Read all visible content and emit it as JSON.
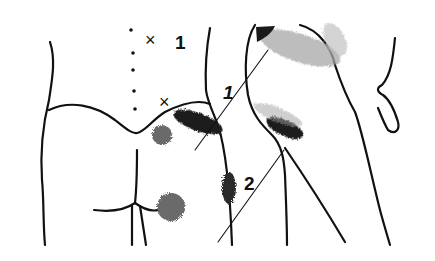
{
  "diagram": {
    "type": "anatomical trigger point / pain referral diagram",
    "view": "posterior lower back, buttocks and lateral hip/thigh",
    "markers": [
      {
        "id": "x1",
        "symbol": "×",
        "label": "1",
        "position": "lower back, lateral to spine"
      },
      {
        "id": "x2",
        "symbol": "×",
        "position": "above iliac crest near sacrum"
      }
    ],
    "leader_labels": [
      {
        "label": "1",
        "target": "pain zone over upper buttock / iliac crest"
      },
      {
        "label": "2",
        "target": "pain zone over lateral hip / greater trochanter"
      }
    ],
    "pain_zones": [
      {
        "name": "upper-buttock-zone",
        "shade": "dark"
      },
      {
        "name": "sacral-spot",
        "shade": "gray"
      },
      {
        "name": "lower-buttock-spot",
        "shade": "gray"
      },
      {
        "name": "lateral-thigh-zone",
        "shade": "dark"
      },
      {
        "name": "hip-crest-zone",
        "shade": "light-stipple"
      },
      {
        "name": "groin-zone",
        "shade": "dark"
      }
    ],
    "colors": {
      "ink": "#111111",
      "dark_zone": "#1a1a1a",
      "gray_zone": "#6b6b6b",
      "stipple": "#9a9a9a",
      "background": "#ffffff"
    }
  }
}
